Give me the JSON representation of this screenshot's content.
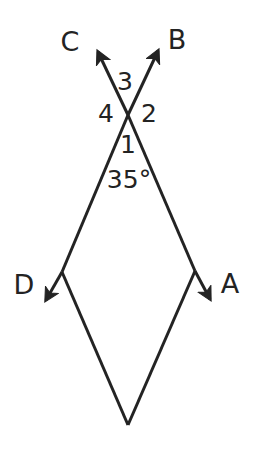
{
  "figure": {
    "type": "geometry-diagram",
    "background_color": "#ffffff",
    "stroke_color": "#232323",
    "stroke_width": 3,
    "canvas": {
      "width": 254,
      "height": 459
    },
    "vertex_labels": [
      {
        "key": "C",
        "text": "C",
        "x": 70,
        "y": 41
      },
      {
        "key": "B",
        "text": "B",
        "x": 177,
        "y": 39
      },
      {
        "key": "D",
        "text": "D",
        "x": 24,
        "y": 284
      },
      {
        "key": "A",
        "text": "A",
        "x": 230,
        "y": 283
      }
    ],
    "angle_labels": [
      {
        "key": "angle3",
        "text": "3",
        "x": 125,
        "y": 81
      },
      {
        "key": "angle4",
        "text": "4",
        "x": 106,
        "y": 113
      },
      {
        "key": "angle2",
        "text": "2",
        "x": 149,
        "y": 113
      },
      {
        "key": "angle1",
        "text": "1",
        "x": 128,
        "y": 144
      }
    ],
    "angle_measures": [
      {
        "key": "measure35",
        "text": "35°",
        "value": 35,
        "unit": "degrees",
        "x": 129,
        "y": 179
      }
    ],
    "points": {
      "crossing": {
        "x": 128,
        "y": 115
      },
      "arrow_tip_C": {
        "x": 94,
        "y": 47
      },
      "arrow_tip_B": {
        "x": 162,
        "y": 45
      },
      "junction_left": {
        "x": 62,
        "y": 272
      },
      "junction_right": {
        "x": 195,
        "y": 271
      },
      "arrow_tip_D": {
        "x": 41,
        "y": 309
      },
      "arrow_tip_A": {
        "x": 214,
        "y": 308
      },
      "bottom_vertex": {
        "x": 128,
        "y": 425
      }
    },
    "segments": [
      {
        "key": "ray-to-C",
        "from": "crossing",
        "to": "arrow_tip_C",
        "arrow": true
      },
      {
        "key": "ray-to-B",
        "from": "crossing",
        "to": "arrow_tip_B",
        "arrow": true
      },
      {
        "key": "ray-to-D",
        "from": "junction_left",
        "to": "arrow_tip_D",
        "arrow": true
      },
      {
        "key": "ray-to-A",
        "from": "junction_right",
        "to": "arrow_tip_A",
        "arrow": true
      },
      {
        "key": "left-upper",
        "from": "crossing",
        "to": "junction_left",
        "arrow": false
      },
      {
        "key": "right-upper",
        "from": "crossing",
        "to": "junction_right",
        "arrow": false
      },
      {
        "key": "left-lower",
        "from": "junction_left",
        "to": "bottom_vertex",
        "arrow": false
      },
      {
        "key": "right-lower",
        "from": "junction_right",
        "to": "bottom_vertex",
        "arrow": false
      }
    ]
  }
}
